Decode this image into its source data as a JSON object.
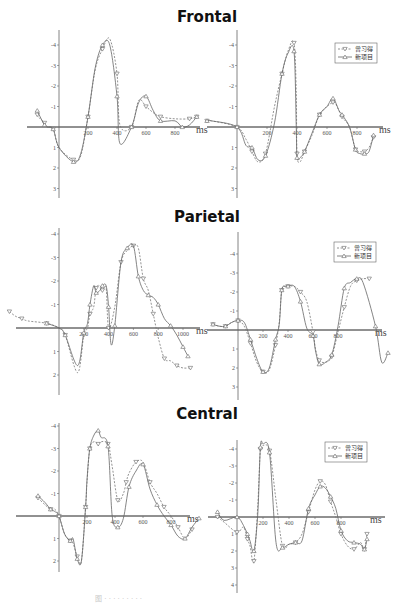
{
  "chart_data": [
    {
      "type": "line",
      "region": "Frontal",
      "title": "Frontal",
      "panel": "left",
      "xlabel": "ms",
      "ylabel": "",
      "x_ticks": [
        "200",
        "400",
        "600",
        "800"
      ],
      "y_ticks": [
        "-4",
        "-3",
        "-2",
        "-1",
        "1",
        "2",
        "3"
      ],
      "ylim": [
        3.5,
        -4.6
      ],
      "xlim": [
        -200,
        950
      ],
      "legend": [],
      "series": [
        {
          "name": "曾习得",
          "x": [
            -150,
            -130,
            -100,
            -80,
            -40,
            0,
            100,
            150,
            200,
            250,
            300,
            350,
            400,
            420,
            500,
            550,
            600,
            650,
            700,
            800,
            900,
            950
          ],
          "y": [
            -0.6,
            -0.4,
            -0.2,
            0.0,
            0.1,
            1.0,
            1.6,
            1.4,
            -0.5,
            -2.8,
            -3.8,
            -4.3,
            -2.6,
            -0.1,
            0.0,
            -1.3,
            -1.0,
            -0.7,
            -0.5,
            -0.4,
            -0.4,
            -0.5
          ]
        },
        {
          "name": "新项目",
          "x": [
            -150,
            -130,
            -100,
            -80,
            -40,
            0,
            100,
            150,
            200,
            250,
            300,
            350,
            400,
            420,
            500,
            550,
            600,
            650,
            700,
            800,
            850,
            900,
            950
          ],
          "y": [
            -0.8,
            -0.5,
            -0.1,
            0.0,
            0.1,
            1.0,
            1.7,
            1.3,
            -0.5,
            -2.9,
            -4.0,
            -4.0,
            -1.5,
            0.8,
            0.0,
            -1.2,
            -1.5,
            -0.8,
            -0.3,
            -0.3,
            0.0,
            -0.1,
            -0.5
          ]
        }
      ]
    },
    {
      "type": "line",
      "region": "Frontal",
      "panel": "right",
      "xlabel": "ms",
      "x_ticks": [
        "200",
        "400",
        "600",
        "800"
      ],
      "y_ticks": [
        "-4",
        "-3",
        "-2",
        "-1",
        "1",
        "2",
        "3"
      ],
      "ylim": [
        3.5,
        -4.6
      ],
      "xlim": [
        -200,
        1000
      ],
      "legend": [
        "曾习得",
        "新项目"
      ],
      "series": [
        {
          "name": "曾习得",
          "x": [
            -200,
            -170,
            0,
            60,
            100,
            140,
            190,
            250,
            300,
            340,
            380,
            395,
            400,
            420,
            450,
            500,
            550,
            600,
            640,
            660,
            700,
            750,
            790,
            820,
            850,
            880,
            910
          ],
          "y": [
            -0.3,
            -0.3,
            0.0,
            0.6,
            1.2,
            1.7,
            1.3,
            -1.0,
            -2.6,
            -3.7,
            -4.1,
            -1.7,
            1.3,
            1.7,
            1.2,
            0.4,
            -0.6,
            -1.0,
            -1.2,
            -1.1,
            -0.5,
            0.0,
            1.1,
            1.2,
            1.2,
            1.0,
            0.5
          ]
        },
        {
          "name": "新项目",
          "x": [
            -200,
            -170,
            0,
            60,
            100,
            140,
            190,
            250,
            300,
            340,
            380,
            395,
            400,
            420,
            450,
            500,
            550,
            600,
            640,
            680,
            700,
            750,
            790,
            820,
            850,
            880,
            910
          ],
          "y": [
            -0.3,
            -0.3,
            0.0,
            0.9,
            1.0,
            1.6,
            1.4,
            -0.2,
            -2.6,
            -3.6,
            -3.7,
            0.0,
            1.5,
            1.5,
            1.2,
            0.3,
            -0.6,
            -1.0,
            -1.4,
            -0.8,
            -0.6,
            0.0,
            1.1,
            1.3,
            1.3,
            1.2,
            0.4
          ]
        }
      ]
    },
    {
      "type": "line",
      "region": "Parietal",
      "title": "Parietal",
      "panel": "left",
      "xlabel": "ms",
      "x_ticks": [
        "200",
        "400",
        "600",
        "800",
        "1000"
      ],
      "y_ticks": [
        "-4",
        "-3",
        "-2",
        "-1",
        "1",
        "2"
      ],
      "ylim": [
        2.6,
        -4.3
      ],
      "xlim": [
        -450,
        1250
      ],
      "legend": [],
      "series": [
        {
          "name": "曾习得",
          "x": [
            -400,
            -350,
            -300,
            -250,
            -100,
            0,
            50,
            150,
            200,
            230,
            250,
            280,
            300,
            330,
            350,
            380,
            400,
            450,
            500,
            550,
            600,
            640,
            680,
            720,
            760,
            800,
            850,
            900,
            950,
            1000,
            1060
          ],
          "y": [
            -0.7,
            -0.5,
            -0.4,
            -0.3,
            -0.2,
            0.0,
            0.3,
            1.9,
            0.3,
            0.0,
            -0.6,
            -0.9,
            -1.7,
            -1.8,
            -1.6,
            -1.7,
            0.0,
            -0.9,
            -2.8,
            -3.3,
            -3.5,
            -3.4,
            -2.1,
            -1.6,
            -0.6,
            0.4,
            1.3,
            1.4,
            1.6,
            1.7,
            1.7
          ]
        },
        {
          "name": "新项目",
          "x": [
            -100,
            0,
            50,
            150,
            200,
            230,
            250,
            280,
            300,
            330,
            350,
            380,
            400,
            420,
            450,
            500,
            550,
            600,
            640,
            680,
            720,
            760,
            800,
            850,
            900,
            950,
            1000,
            1040
          ],
          "y": [
            -0.2,
            0.0,
            0.3,
            1.6,
            0.2,
            -0.2,
            -1.0,
            -1.8,
            -1.5,
            -1.6,
            -1.8,
            -1.8,
            -0.9,
            0.7,
            -0.1,
            -2.8,
            -3.4,
            -3.5,
            -2.2,
            -1.6,
            -1.4,
            -1.3,
            -1.0,
            -0.4,
            -0.1,
            0.3,
            0.8,
            1.2
          ]
        }
      ]
    },
    {
      "type": "line",
      "region": "Parietal",
      "panel": "right",
      "xlabel": "ms",
      "x_ticks": [
        "200",
        "400",
        "600",
        "800"
      ],
      "y_ticks": [
        "-4",
        "-3",
        "-2",
        "-1",
        "1",
        "2",
        "3"
      ],
      "ylim": [
        3.4,
        -4.6
      ],
      "xlim": [
        -250,
        1200
      ],
      "legend": [
        "曾习得",
        "新项目"
      ],
      "series": [
        {
          "name": "曾习得",
          "x": [
            -200,
            -150,
            -100,
            -50,
            0,
            50,
            100,
            150,
            200,
            250,
            300,
            330,
            350,
            380,
            400,
            450,
            500,
            550,
            600,
            620,
            650,
            700,
            750,
            800,
            850,
            900,
            950,
            1000,
            1050
          ],
          "y": [
            -0.3,
            -0.2,
            -0.2,
            -0.4,
            -0.5,
            -0.2,
            0.7,
            1.7,
            2.2,
            2.1,
            0.8,
            -0.4,
            -2.1,
            -2.3,
            -2.3,
            -2.3,
            -2.0,
            -1.5,
            0.1,
            1.0,
            1.6,
            1.7,
            1.4,
            0.1,
            -1.2,
            -2.3,
            -2.6,
            -2.7,
            -2.7
          ]
        },
        {
          "name": "新项目",
          "x": [
            -200,
            -150,
            -100,
            -50,
            0,
            50,
            100,
            150,
            200,
            250,
            300,
            330,
            350,
            380,
            400,
            450,
            500,
            550,
            600,
            620,
            650,
            700,
            750,
            800,
            850,
            900,
            950,
            1000,
            1100,
            1150,
            1200
          ],
          "y": [
            -0.3,
            -0.2,
            -0.2,
            -0.4,
            -0.5,
            -0.4,
            0.5,
            1.5,
            2.2,
            2.0,
            0.5,
            -0.3,
            -2.1,
            -2.3,
            -2.3,
            -2.3,
            -1.5,
            -0.1,
            0.3,
            1.1,
            1.8,
            1.7,
            1.3,
            -0.2,
            -2.2,
            -2.5,
            -2.7,
            -2.5,
            -0.2,
            1.7,
            1.2
          ]
        }
      ]
    },
    {
      "type": "line",
      "region": "Central",
      "title": "Central",
      "panel": "left",
      "xlabel": "ms",
      "x_ticks": [
        "200",
        "400",
        "600",
        "800"
      ],
      "y_ticks": [
        "-4",
        "-3",
        "-2",
        "-1",
        "1",
        "2"
      ],
      "ylim": [
        2.6,
        -4.3
      ],
      "xlim": [
        -200,
        1050
      ],
      "legend": [],
      "series": [
        {
          "name": "曾习得",
          "x": [
            -150,
            -100,
            -60,
            -30,
            0,
            40,
            80,
            100,
            130,
            160,
            190,
            200,
            220,
            250,
            280,
            300,
            350,
            380,
            420,
            460,
            480,
            500,
            550,
            600,
            650,
            700,
            750,
            800,
            850,
            900,
            950
          ],
          "y": [
            -0.8,
            -0.5,
            -0.3,
            -0.3,
            0.0,
            0.8,
            1.1,
            1.2,
            1.8,
            2.0,
            -0.4,
            -1.5,
            -3.0,
            -3.3,
            -3.2,
            -3.3,
            -3.2,
            -2.2,
            -0.7,
            -1.0,
            -1.5,
            -1.9,
            -2.4,
            -2.4,
            -1.5,
            -1.0,
            -0.4,
            0.0,
            0.5,
            1.0,
            0.6
          ]
        },
        {
          "name": "新项目",
          "x": [
            -150,
            -100,
            -60,
            -30,
            0,
            40,
            80,
            100,
            130,
            160,
            190,
            200,
            220,
            250,
            280,
            300,
            350,
            380,
            420,
            460,
            500,
            550,
            600,
            650,
            700,
            750,
            800,
            850,
            900,
            950,
            1000
          ],
          "y": [
            -0.9,
            -0.6,
            -0.3,
            -0.2,
            0.0,
            0.8,
            1.1,
            1.0,
            1.9,
            2.0,
            -0.4,
            -1.6,
            -3.0,
            -3.6,
            -3.8,
            -3.5,
            -3.1,
            0.0,
            0.5,
            0.1,
            -1.3,
            -2.0,
            -2.3,
            -1.2,
            -0.5,
            0.0,
            0.4,
            0.9,
            1.0,
            0.5,
            0.1
          ]
        }
      ]
    },
    {
      "type": "line",
      "region": "Central",
      "panel": "right",
      "xlabel": "ms",
      "x_ticks": [
        "200",
        "400",
        "600",
        "800"
      ],
      "y_ticks": [
        "-4",
        "-3",
        "-2",
        "-1",
        "1",
        "2",
        "3",
        "4"
      ],
      "ylim": [
        4.4,
        -4.6
      ],
      "xlim": [
        -200,
        1100
      ],
      "legend": [
        "曾习得",
        "新项目"
      ],
      "series": [
        {
          "name": "曾习得",
          "x": [
            -150,
            -100,
            0,
            50,
            80,
            100,
            130,
            160,
            180,
            200,
            250,
            300,
            350,
            400,
            450,
            500,
            550,
            600,
            640,
            680,
            720,
            760,
            800,
            850,
            900,
            950,
            980,
            1000
          ],
          "y": [
            0.0,
            0.3,
            0.9,
            0.6,
            1.3,
            1.7,
            2.6,
            -0.7,
            -4.0,
            -4.2,
            -3.9,
            -1.0,
            1.7,
            1.6,
            1.5,
            1.0,
            -0.3,
            -1.6,
            -2.1,
            -1.9,
            -0.9,
            0.0,
            1.0,
            1.7,
            1.9,
            1.5,
            1.9,
            1.0
          ]
        },
        {
          "name": "新项目",
          "x": [
            -150,
            -100,
            0,
            50,
            80,
            100,
            130,
            160,
            180,
            200,
            250,
            300,
            350,
            400,
            450,
            500,
            550,
            600,
            640,
            680,
            720,
            760,
            800,
            850,
            900,
            950,
            980,
            1000
          ],
          "y": [
            -0.3,
            0.2,
            0.0,
            0.5,
            1.0,
            1.4,
            2.0,
            -0.2,
            -4.1,
            -4.3,
            -3.8,
            1.5,
            1.8,
            1.6,
            1.5,
            1.4,
            -0.5,
            -1.3,
            -1.8,
            -1.7,
            -1.2,
            -0.5,
            0.8,
            1.4,
            1.5,
            1.6,
            1.9,
            1.3
          ]
        }
      ]
    }
  ],
  "titles": {
    "frontal": "Frontal",
    "parietal": "Parietal",
    "central": "Central"
  },
  "legend_labels": [
    "曾习得",
    "新项目"
  ],
  "axis_unit": "ms",
  "caption": "图 · · · · · · · · ·"
}
